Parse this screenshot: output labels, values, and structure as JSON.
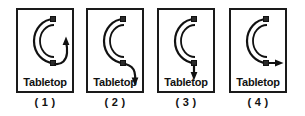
{
  "figure": {
    "kind": "physics-multiple-choice-diagram",
    "description_label": "Tabletop with curved tube viewed from above",
    "panel_count": 4,
    "stroke_color": "#111111",
    "background_color": "#ffffff"
  },
  "panels": [
    {
      "id": "panel-1",
      "caption": "( 1 )",
      "surface_label": "Tabletop",
      "tube_shape": "C-shaped half-circle tube, opening to the right",
      "trajectory": "curved path continuing clockwise around the circle, arrow pointing up-right",
      "arrow_direction": "curved-clockwise-up-right"
    },
    {
      "id": "panel-2",
      "caption": "( 2 )",
      "surface_label": "Tabletop",
      "tube_shape": "C-shaped half-circle tube, opening to the right",
      "trajectory": "path curving gently to the right then downward, arrow pointing down",
      "arrow_direction": "curved-right-then-down"
    },
    {
      "id": "panel-3",
      "caption": "( 3 )",
      "surface_label": "Tabletop",
      "tube_shape": "C-shaped half-circle tube, opening to the right",
      "trajectory": "straight path going downward, arrow pointing down",
      "arrow_direction": "straight-down"
    },
    {
      "id": "panel-4",
      "caption": "( 4 )",
      "surface_label": "Tabletop",
      "tube_shape": "C-shaped half-circle tube, opening to the right",
      "trajectory": "straight path going to the right, arrow pointing right",
      "arrow_direction": "straight-right"
    }
  ]
}
